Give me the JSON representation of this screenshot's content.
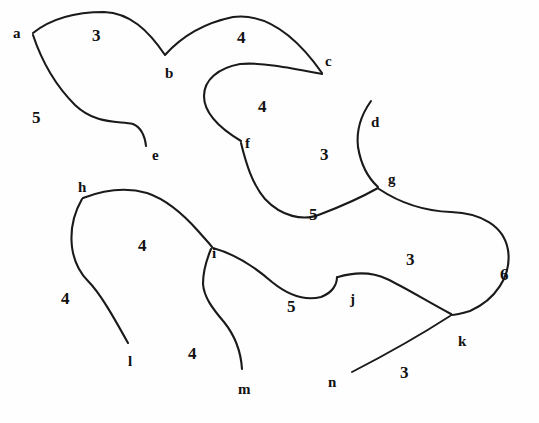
{
  "diagram": {
    "background_color": "#fefefe",
    "stroke_color": "#1a1a1a",
    "width": 539,
    "height": 423,
    "vertices": [
      {
        "id": "a",
        "label": "a",
        "x": 13,
        "y": 26
      },
      {
        "id": "b",
        "label": "b",
        "x": 165,
        "y": 66
      },
      {
        "id": "c",
        "label": "c",
        "x": 325,
        "y": 54
      },
      {
        "id": "d",
        "label": "d",
        "x": 371,
        "y": 115
      },
      {
        "id": "e",
        "label": "e",
        "x": 152,
        "y": 148
      },
      {
        "id": "f",
        "label": "f",
        "x": 245,
        "y": 136
      },
      {
        "id": "g",
        "label": "g",
        "x": 388,
        "y": 172
      },
      {
        "id": "h",
        "label": "h",
        "x": 78,
        "y": 180
      },
      {
        "id": "i",
        "label": "i",
        "x": 212,
        "y": 246
      },
      {
        "id": "j",
        "label": "j",
        "x": 350,
        "y": 292
      },
      {
        "id": "k",
        "label": "k",
        "x": 458,
        "y": 334
      },
      {
        "id": "l",
        "label": "l",
        "x": 128,
        "y": 354
      },
      {
        "id": "m",
        "label": "m",
        "x": 238,
        "y": 382
      },
      {
        "id": "n",
        "label": "n",
        "x": 328,
        "y": 375
      }
    ],
    "weights": [
      {
        "id": "w-ab",
        "label": "3",
        "x": 92,
        "y": 27
      },
      {
        "id": "w-bc",
        "label": "4",
        "x": 237,
        "y": 29
      },
      {
        "id": "w-ae",
        "label": "5",
        "x": 32,
        "y": 109
      },
      {
        "id": "w-cf",
        "label": "4",
        "x": 258,
        "y": 98
      },
      {
        "id": "w-fg",
        "label": "3",
        "x": 320,
        "y": 146
      },
      {
        "id": "w-fg2",
        "label": "5",
        "x": 309,
        "y": 206
      },
      {
        "id": "w-hi",
        "label": "4",
        "x": 138,
        "y": 237
      },
      {
        "id": "w-hl",
        "label": "4",
        "x": 61,
        "y": 290
      },
      {
        "id": "w-im",
        "label": "4",
        "x": 188,
        "y": 345
      },
      {
        "id": "w-ij",
        "label": "5",
        "x": 287,
        "y": 298
      },
      {
        "id": "w-jg",
        "label": "3",
        "x": 406,
        "y": 251
      },
      {
        "id": "w-gk",
        "label": "6",
        "x": 500,
        "y": 266
      },
      {
        "id": "w-nk",
        "label": "3",
        "x": 400,
        "y": 364
      }
    ],
    "edges": [
      {
        "id": "edge-a-b",
        "from": "a",
        "to": "b",
        "weight": "3"
      },
      {
        "id": "edge-b-c",
        "from": "b",
        "to": "c",
        "weight": "4"
      },
      {
        "id": "edge-a-e",
        "from": "a",
        "to": "e",
        "weight": "5"
      },
      {
        "id": "edge-c-f",
        "from": "c",
        "to": "f",
        "weight": "4"
      },
      {
        "id": "edge-f-g",
        "from": "f",
        "to": "g",
        "weight": "5"
      },
      {
        "id": "edge-d-g",
        "from": "d",
        "to": "g",
        "weight": "3"
      },
      {
        "id": "edge-g-k",
        "from": "g",
        "to": "k",
        "weight": "6"
      },
      {
        "id": "edge-h-i",
        "from": "h",
        "to": "i",
        "weight": "4"
      },
      {
        "id": "edge-h-l",
        "from": "h",
        "to": "l",
        "weight": "4"
      },
      {
        "id": "edge-i-m",
        "from": "i",
        "to": "m",
        "weight": "4"
      },
      {
        "id": "edge-i-j",
        "from": "i",
        "to": "j",
        "weight": "5"
      },
      {
        "id": "edge-j-k",
        "from": "j",
        "to": "k",
        "weight": "3"
      },
      {
        "id": "edge-n-k",
        "from": "n",
        "to": "k",
        "weight": "3"
      }
    ],
    "paths": {
      "a_b_c": "M 33,33 C 48,21 72,12 104,12 C 130,13 148,30 165,55 C 182,36 204,23 233,17 C 266,13 296,36 322,73",
      "a_e": "M 33,35 C 42,62 56,86 75,105 C 95,124 116,121 133,124 C 142,128 145,137 146,146",
      "c_f": "M 322,74 C 291,68 262,62 240,64 C 218,68 204,80 204,96 C 204,112 216,126 241,141",
      "f_g": "M 241,143 C 246,163 252,184 265,199 C 281,216 303,222 321,214 C 342,206 362,197 378,188",
      "d_g": "M 371,101 C 361,115 356,130 358,147 C 361,165 368,178 378,187",
      "g_k": "M 379,189 C 400,203 424,211 451,212 C 481,213 504,226 508,250 C 512,276 495,300 470,311 C 460,314 454,315 451,315",
      "h_i": "M 83,198 C 104,190 126,187 147,193 C 168,200 185,216 199,232 C 205,239 209,243 212,247",
      "h_l": "M 82,199 C 74,213 70,230 72,247 C 74,262 80,273 88,281 C 100,293 113,316 128,343",
      "i_m": "M 211,249 C 206,261 203,272 203,284 C 204,297 212,308 224,322 C 236,337 241,353 242,369",
      "i_j": "M 213,248 C 235,254 256,268 272,282 C 288,295 305,301 321,297 C 332,293 337,285 337,277",
      "j_k": "M 338,277 C 355,272 372,272 387,279 C 404,287 425,300 451,314",
      "n_k": "M 352,372 C 385,355 419,336 450,316"
    }
  }
}
